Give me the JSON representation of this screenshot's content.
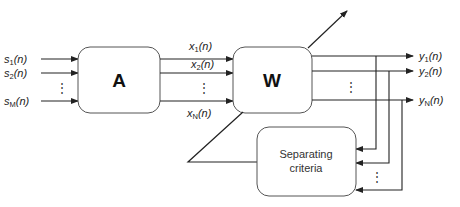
{
  "diagram": {
    "type": "block-diagram",
    "blocks": {
      "mixing": {
        "label": "A"
      },
      "demixing": {
        "label": "W"
      },
      "criteria": {
        "line1": "Separating",
        "line2": "criteria"
      }
    },
    "inputs": [
      {
        "base": "s",
        "sub": "1",
        "arg": "(n)"
      },
      {
        "base": "s",
        "sub": "2",
        "arg": "(n)"
      },
      {
        "base": "s",
        "sub": "M",
        "arg": "(n)"
      }
    ],
    "mixtures": [
      {
        "base": "x",
        "sub": "1",
        "arg": "(n)"
      },
      {
        "base": "x",
        "sub": "2",
        "arg": "(n)"
      },
      {
        "base": "x",
        "sub": "N",
        "arg": "(n)"
      }
    ],
    "outputs": [
      {
        "base": "y",
        "sub": "1",
        "arg": "(n)"
      },
      {
        "base": "y",
        "sub": "2",
        "arg": "(n)"
      },
      {
        "base": "y",
        "sub": "N",
        "arg": "(n)"
      }
    ],
    "ellipsis": "⋮",
    "colors": {
      "stroke": "#222222",
      "box_stroke": "#555555",
      "background": "#ffffff"
    }
  }
}
